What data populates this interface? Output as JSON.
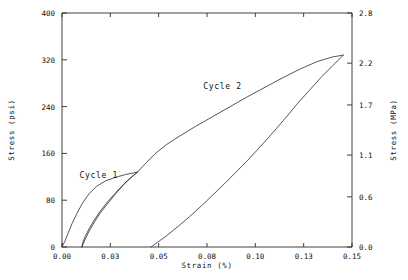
{
  "chart_data": {
    "type": "line",
    "title": "",
    "xlabel": "Strain  (%)",
    "ylabel": "Stress  (psi)",
    "ylabel_right": "Stress  (MPa)",
    "xlim": [
      0.0,
      0.15
    ],
    "ylim": [
      0,
      400
    ],
    "ylim_right": [
      0.0,
      2.8
    ],
    "grid": false,
    "legend": "none",
    "xticks": [
      0.0,
      0.025,
      0.05,
      0.075,
      0.1,
      0.125,
      0.15
    ],
    "xticklabels": [
      "0.00",
      "0.03",
      "0.05",
      "0.08",
      "0.10",
      "0.13",
      "0.15"
    ],
    "yticks": [
      0,
      80,
      160,
      240,
      320,
      400
    ],
    "yticklabels": [
      "0",
      "80",
      "160",
      "240",
      "320",
      "400"
    ],
    "yticks_right": [
      0.0,
      0.6,
      1.1,
      1.7,
      2.2,
      2.8
    ],
    "yticklabels_right": [
      "0.0",
      "0.6",
      "1.1",
      "1.7",
      "2.2",
      "2.8"
    ],
    "annotations": [
      {
        "text": "Cycle 1",
        "x": 0.009,
        "y": 118
      },
      {
        "text": "Cycle 2",
        "x": 0.073,
        "y": 270
      }
    ],
    "series": [
      {
        "name": "Cycle 1 loading",
        "points": [
          [
            0.0,
            0
          ],
          [
            0.0015,
            10
          ],
          [
            0.0032,
            24
          ],
          [
            0.0052,
            40
          ],
          [
            0.0078,
            58
          ],
          [
            0.0108,
            76
          ],
          [
            0.014,
            91
          ],
          [
            0.018,
            104
          ],
          [
            0.0225,
            113
          ],
          [
            0.0275,
            119
          ],
          [
            0.033,
            124
          ],
          [
            0.039,
            128
          ]
        ]
      },
      {
        "name": "Cycle 1 unloading",
        "points": [
          [
            0.039,
            128
          ],
          [
            0.035,
            117
          ],
          [
            0.031,
            104
          ],
          [
            0.027,
            90
          ],
          [
            0.023,
            75
          ],
          [
            0.0195,
            60
          ],
          [
            0.0165,
            45
          ],
          [
            0.014,
            31
          ],
          [
            0.012,
            18
          ],
          [
            0.0108,
            8
          ],
          [
            0.0103,
            0
          ]
        ]
      },
      {
        "name": "Cycle 1 reload",
        "points": [
          [
            0.0103,
            0
          ],
          [
            0.0118,
            12
          ],
          [
            0.014,
            27
          ],
          [
            0.0168,
            43
          ],
          [
            0.02,
            59
          ],
          [
            0.0238,
            75
          ],
          [
            0.028,
            92
          ],
          [
            0.0325,
            109
          ],
          [
            0.0362,
            120
          ],
          [
            0.039,
            128
          ]
        ]
      },
      {
        "name": "Cycle 2 loading",
        "points": [
          [
            0.039,
            128
          ],
          [
            0.043,
            142
          ],
          [
            0.048,
            159
          ],
          [
            0.054,
            175
          ],
          [
            0.061,
            190
          ],
          [
            0.069,
            206
          ],
          [
            0.078,
            223
          ],
          [
            0.087,
            240
          ],
          [
            0.096,
            257
          ],
          [
            0.105,
            273
          ],
          [
            0.114,
            289
          ],
          [
            0.123,
            304
          ],
          [
            0.132,
            317
          ],
          [
            0.14,
            325
          ],
          [
            0.1455,
            328
          ]
        ]
      },
      {
        "name": "Cycle 2 unloading",
        "points": [
          [
            0.1455,
            328
          ],
          [
            0.14,
            310
          ],
          [
            0.134,
            290
          ],
          [
            0.128,
            268
          ],
          [
            0.122,
            246
          ],
          [
            0.1165,
            224
          ],
          [
            0.111,
            203
          ],
          [
            0.106,
            184
          ],
          [
            0.101,
            166
          ],
          [
            0.096,
            148
          ],
          [
            0.09,
            128
          ],
          [
            0.084,
            108
          ],
          [
            0.078,
            89
          ],
          [
            0.072,
            70
          ],
          [
            0.066,
            52
          ],
          [
            0.06,
            35
          ],
          [
            0.054,
            19
          ],
          [
            0.049,
            7
          ],
          [
            0.046,
            0
          ]
        ]
      }
    ]
  }
}
